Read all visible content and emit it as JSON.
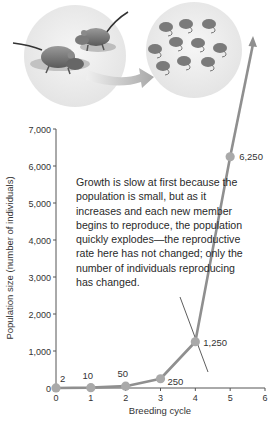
{
  "chart_data": {
    "type": "line",
    "title": "",
    "xlabel": "Breeding cycle",
    "ylabel": "Population size (number of individuals)",
    "x": [
      0,
      1,
      2,
      3,
      4,
      5
    ],
    "series": [
      {
        "name": "Population",
        "values": [
          2,
          10,
          50,
          250,
          1250,
          6250
        ]
      }
    ],
    "point_labels": [
      "2",
      "10",
      "50",
      "250",
      "1,250",
      "6,250"
    ],
    "x_ticks": [
      "0",
      "1",
      "2",
      "3",
      "4",
      "5",
      "6"
    ],
    "y_ticks": [
      "0",
      "1,000",
      "2,000",
      "3,000",
      "4,000",
      "5,000",
      "6,000",
      "7,000"
    ],
    "xlim": [
      0,
      6
    ],
    "ylim": [
      0,
      7000
    ],
    "grid": false,
    "legend": "none",
    "arrow_continuation": true,
    "annotation": "Growth is slow at first because the population is small, but as it increases and each new member begins to reproduce, the  population quickly explodes—the reproductive rate here has not changed; only the number of individuals reproducing has changed.",
    "illustration": "Two mice (left circle) producing many offspring mice (right circle) with an arrow between"
  },
  "colors": {
    "line": "#8f8f8f",
    "point": "#a9a9a9",
    "axis": "#555555",
    "text": "#2a2a2a",
    "circle": "#ececec"
  }
}
